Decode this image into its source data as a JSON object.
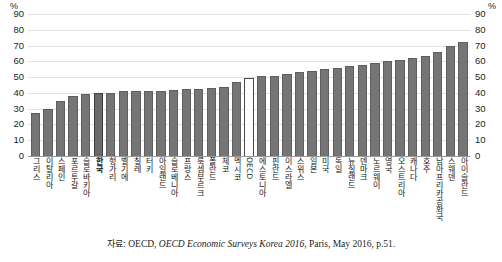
{
  "chart_data": {
    "type": "bar",
    "title": "",
    "subtitle": "",
    "xlabel": "",
    "ylabel": "%",
    "unit_left": "%",
    "unit_right": "%",
    "ylim": [
      0,
      90
    ],
    "yticks": [
      0,
      10,
      20,
      30,
      40,
      50,
      60,
      70,
      80,
      90
    ],
    "grid": true,
    "legend": "none",
    "highlight_category": "한국",
    "average_category": "OECD",
    "categories": [
      "그리스",
      "이탈리아",
      "스페인",
      "포르투갈",
      "슬로바키아",
      "한국",
      "헝가리",
      "벨기에",
      "칠레",
      "터키",
      "아일랜드",
      "슬로베니아",
      "프랑스",
      "룩셈부르크",
      "폴란드",
      "체코",
      "멕시코",
      "OECD",
      "에스토니아",
      "핀란드",
      "이스라엘",
      "스위스",
      "일본",
      "미국",
      "독일",
      "뉴질랜드",
      "덴마크",
      "노르웨이",
      "영국",
      "오스트리아",
      "캐나다",
      "호주",
      "남아프리카공화국",
      "스웨덴",
      "아이슬란드"
    ],
    "values": [
      27,
      30,
      35,
      38,
      39,
      40,
      40,
      41,
      41,
      41,
      41.5,
      42,
      42.5,
      42.5,
      43,
      44,
      47,
      49.5,
      50.5,
      51,
      52,
      53,
      54,
      55,
      56,
      57,
      58,
      59,
      60.5,
      61,
      62,
      63.5,
      66,
      70,
      72.5
    ],
    "source_prefix": "자료:",
    "source_org": "OECD,",
    "source_title": "OECD Economic Surveys Korea 2016",
    "source_rest": ", Paris, May 2016, p.51.",
    "colors": {
      "bar": "#757575",
      "bar_border": "#5e5e5e",
      "highlight": "#6a6a6a",
      "average": "#fdfdfd",
      "grid": "#e2e2e2",
      "axis": "#9a9a9a",
      "text": "#1a1a1a"
    }
  }
}
